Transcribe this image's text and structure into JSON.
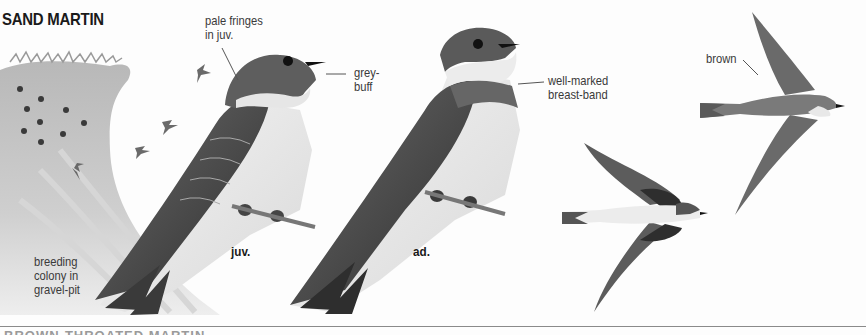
{
  "species": {
    "title": "SAND MARTIN",
    "next_species_title": "BROWN-THROATED MARTIN"
  },
  "annotations": {
    "pale_fringes": "pale fringes in juv.",
    "grey_buff": "grey-buff",
    "breast_band": "well-marked breast-band",
    "brown": "brown",
    "breeding_colony": "breeding colony in gravel-pit"
  },
  "labels": {
    "pale_fringes_l1": "pale fringes",
    "pale_fringes_l2": "in juv.",
    "grey_buff_l1": "grey-",
    "grey_buff_l2": "buff",
    "breast_band_l1": "well-marked",
    "breast_band_l2": "breast-band",
    "brown": "brown",
    "colony_l1": "breeding",
    "colony_l2": "colony in",
    "colony_l3": "gravel-pit",
    "juvenile": "juv.",
    "adult": "ad."
  },
  "figures": [
    {
      "id": "gravel-pit-colony",
      "description": "sandy bank with nest holes and small flying martins"
    },
    {
      "id": "juvenile-perched",
      "age": "juv."
    },
    {
      "id": "adult-perched",
      "age": "ad."
    },
    {
      "id": "flight-underside",
      "view": "from below"
    },
    {
      "id": "flight-upperside",
      "view": "from above"
    }
  ],
  "colors": {
    "ink": "#1a1a1a",
    "label_text": "#3a3a3a",
    "upperparts": "#5a5a5a",
    "underparts": "#efefef",
    "bank": "#bdbdbd"
  }
}
